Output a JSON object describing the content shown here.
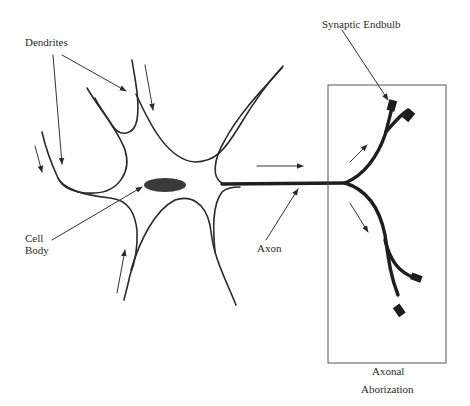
{
  "diagram": {
    "labels": {
      "dendrites": "Dendrites",
      "synaptic_endbulb": "Synaptic Endbulb",
      "cell_body_line1": "Cell",
      "cell_body_line2": "Body",
      "axon": "Axon",
      "axonal_line1": "Axonal",
      "axonal_line2": "Aborization"
    },
    "colors": {
      "stroke": "#2b2b2b",
      "nucleus": "#3a3a3a",
      "box": "#555555",
      "background": "#ffffff"
    },
    "signal_direction": "dendrites -> cell body -> axon -> axonal aborization"
  }
}
